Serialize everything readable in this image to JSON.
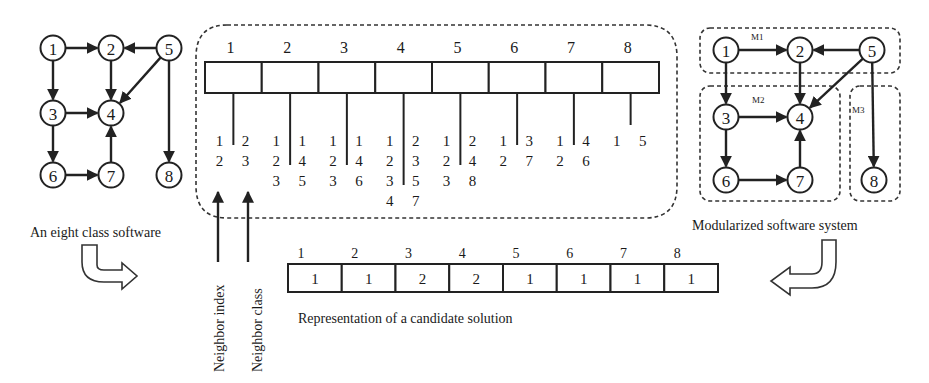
{
  "left_graph": {
    "caption": "An eight class software",
    "nodes": [
      {
        "id": "1",
        "x": 53,
        "y": 48
      },
      {
        "id": "2",
        "x": 111,
        "y": 48
      },
      {
        "id": "5",
        "x": 169,
        "y": 48
      },
      {
        "id": "3",
        "x": 53,
        "y": 113
      },
      {
        "id": "4",
        "x": 111,
        "y": 113
      },
      {
        "id": "6",
        "x": 53,
        "y": 175
      },
      {
        "id": "7",
        "x": 111,
        "y": 175
      },
      {
        "id": "8",
        "x": 169,
        "y": 175
      }
    ],
    "edges": [
      [
        "1",
        "2"
      ],
      [
        "5",
        "2"
      ],
      [
        "1",
        "3"
      ],
      [
        "2",
        "4"
      ],
      [
        "5",
        "4"
      ],
      [
        "3",
        "4"
      ],
      [
        "3",
        "6"
      ],
      [
        "6",
        "7"
      ],
      [
        "7",
        "4"
      ],
      [
        "5",
        "8"
      ]
    ]
  },
  "neighbor_array": {
    "indices": [
      "1",
      "2",
      "3",
      "4",
      "5",
      "6",
      "7",
      "8"
    ],
    "columns": [
      {
        "index": [
          "1",
          "2"
        ],
        "class": [
          "2",
          "3"
        ]
      },
      {
        "index": [
          "1",
          "2",
          "3"
        ],
        "class": [
          "1",
          "4",
          "5"
        ]
      },
      {
        "index": [
          "1",
          "2",
          "3"
        ],
        "class": [
          "1",
          "4",
          "6"
        ]
      },
      {
        "index": [
          "1",
          "2",
          "3",
          "4"
        ],
        "class": [
          "2",
          "3",
          "5",
          "7"
        ]
      },
      {
        "index": [
          "1",
          "2",
          "3"
        ],
        "class": [
          "2",
          "4",
          "8"
        ]
      },
      {
        "index": [
          "1",
          "2"
        ],
        "class": [
          "3",
          "7"
        ]
      },
      {
        "index": [
          "1",
          "2"
        ],
        "class": [
          "4",
          "6"
        ]
      },
      {
        "index": [
          "1"
        ],
        "class": [
          "5"
        ]
      }
    ],
    "label_neighbor_index": "Neighbor index",
    "label_neighbor_class": "Neighbor class"
  },
  "candidate_solution": {
    "indices": [
      "1",
      "2",
      "3",
      "4",
      "5",
      "6",
      "7",
      "8"
    ],
    "values": [
      "1",
      "1",
      "2",
      "2",
      "1",
      "1",
      "1",
      "1"
    ],
    "caption": "Representation of a candidate solution"
  },
  "right_graph": {
    "caption": "Modularized software system",
    "modules": [
      {
        "label": "M1",
        "members": [
          "1",
          "2",
          "5"
        ]
      },
      {
        "label": "M2",
        "members": [
          "3",
          "4",
          "6",
          "7"
        ]
      },
      {
        "label": "M3",
        "members": [
          "8"
        ]
      }
    ],
    "nodes": [
      {
        "id": "1",
        "x": 726,
        "y": 50
      },
      {
        "id": "2",
        "x": 800,
        "y": 50
      },
      {
        "id": "5",
        "x": 872,
        "y": 50
      },
      {
        "id": "3",
        "x": 726,
        "y": 117
      },
      {
        "id": "4",
        "x": 800,
        "y": 117
      },
      {
        "id": "6",
        "x": 726,
        "y": 180
      },
      {
        "id": "7",
        "x": 800,
        "y": 180
      },
      {
        "id": "8",
        "x": 874,
        "y": 180
      }
    ],
    "edges": [
      [
        "1",
        "2"
      ],
      [
        "5",
        "2"
      ],
      [
        "1",
        "3"
      ],
      [
        "2",
        "4"
      ],
      [
        "5",
        "4"
      ],
      [
        "3",
        "4"
      ],
      [
        "3",
        "6"
      ],
      [
        "6",
        "7"
      ],
      [
        "7",
        "4"
      ],
      [
        "5",
        "8"
      ]
    ]
  }
}
